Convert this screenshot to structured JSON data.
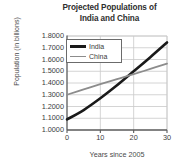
{
  "chart_data": {
    "type": "line",
    "title": "Projected Populations of India and China",
    "title_line1": "Projected Populations of",
    "title_line2": "India and China",
    "xlabel": "Years since 2005",
    "ylabel": "Population (in billions)",
    "xlim": [
      0,
      30
    ],
    "ylim": [
      1.0,
      1.8
    ],
    "grid": true,
    "legend_position": "top-left-inside",
    "xticks": [
      "0",
      "10",
      "20",
      "30"
    ],
    "xtick_values": [
      0,
      10,
      20,
      30
    ],
    "yticks": [
      "1.0000",
      "1.1000",
      "1.2000",
      "1.3000",
      "1.4000",
      "1.5000",
      "1.6000",
      "1.7000",
      "1.8000"
    ],
    "ytick_values": [
      1.0,
      1.1,
      1.2,
      1.3,
      1.4,
      1.5,
      1.6,
      1.7,
      1.8
    ],
    "x": [
      0,
      5,
      10,
      15,
      20,
      25,
      30
    ],
    "series": [
      {
        "name": "India",
        "color": "#1a1a1a",
        "width": 2.6,
        "values": [
          1.09,
          1.17,
          1.27,
          1.38,
          1.5,
          1.62,
          1.745
        ]
      },
      {
        "name": "China",
        "color": "#8c8c8c",
        "width": 1.8,
        "values": [
          1.3,
          1.345,
          1.39,
          1.433,
          1.475,
          1.52,
          1.565
        ]
      }
    ],
    "intersection": {
      "x": 19.5,
      "y": 1.483
    }
  },
  "colors": {
    "india": "#1a1a1a",
    "china": "#8c8c8c",
    "grid": "#c9c9c9",
    "axis": "#5a5a5a",
    "text": "#3d3d3d",
    "background": "#ffffff"
  }
}
